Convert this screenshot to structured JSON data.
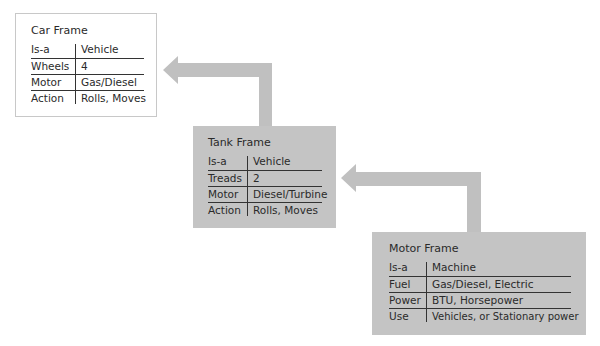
{
  "colors": {
    "arrow": "#c0c0c0",
    "frame_fill_gray": "#c4c4c4",
    "frame_fill_white": "#ffffff",
    "rule": "#333333"
  },
  "frames": {
    "car": {
      "title": "Car Frame",
      "rows": [
        {
          "key": "Is-a",
          "value": "Vehicle"
        },
        {
          "key": "Wheels",
          "value": "4"
        },
        {
          "key": "Motor",
          "value": "Gas/Diesel"
        },
        {
          "key": "Action",
          "value": "Rolls, Moves"
        }
      ]
    },
    "tank": {
      "title": "Tank Frame",
      "rows": [
        {
          "key": "Is-a",
          "value": "Vehicle"
        },
        {
          "key": "Treads",
          "value": "2"
        },
        {
          "key": "Motor",
          "value": "Diesel/Turbine"
        },
        {
          "key": "Action",
          "value": "Rolls, Moves"
        }
      ]
    },
    "motor": {
      "title": "Motor Frame",
      "rows": [
        {
          "key": "Is-a",
          "value": "Machine"
        },
        {
          "key": "Fuel",
          "value": "Gas/Diesel, Electric"
        },
        {
          "key": "Power",
          "value": "BTU, Horsepower"
        },
        {
          "key": "Use",
          "value": "Vehicles, or Stationary power"
        }
      ]
    }
  },
  "arrows": [
    {
      "from": "Tank Frame",
      "to": "Car Frame"
    },
    {
      "from": "Motor Frame",
      "to": "Tank Frame"
    }
  ]
}
